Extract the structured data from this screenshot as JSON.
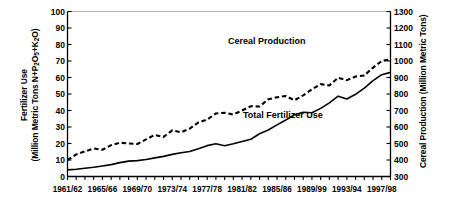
{
  "chart_data": {
    "type": "line",
    "title": "",
    "xlabel": "",
    "grid": false,
    "legend_position": "inline-annotation",
    "x": [
      "1961/62",
      "1962/63",
      "1963/64",
      "1964/65",
      "1965/66",
      "1966/67",
      "1967/68",
      "1968/69",
      "1969/70",
      "1970/71",
      "1971/72",
      "1972/73",
      "1973/74",
      "1974/75",
      "1975/76",
      "1976/77",
      "1977/78",
      "1978/79",
      "1979/80",
      "1980/81",
      "1981/82",
      "1982/83",
      "1983/84",
      "1984/85",
      "1985/86",
      "1986/87",
      "1987/88",
      "1988/89",
      "1989/99",
      "1990/91",
      "1991/92",
      "1992/93",
      "1993/94",
      "1994/95",
      "1995/96",
      "1996/97",
      "1997/98",
      "1998/99"
    ],
    "xticklabels": [
      "1961/62",
      "1965/66",
      "1969/70",
      "1973/74",
      "1977/78",
      "1981/82",
      "1985/86",
      "1989/99",
      "1993/94",
      "1997/98"
    ],
    "xtick_indices": [
      0,
      4,
      8,
      12,
      16,
      20,
      24,
      28,
      32,
      36
    ],
    "axes": [
      {
        "id": "left",
        "label_line1": "Fertilizer Use",
        "label_line2_prefix": "(Million Metric Tons N+P",
        "label_line2_sub1": "2",
        "label_line2_mid": "O",
        "label_line2_sub2": "5",
        "label_line2_mid2": "+K",
        "label_line2_sub3": "2",
        "label_line2_suffix": "O)",
        "label_plain": "Fertilizer Use (Million Metric Tons N+P2O5+K2O)",
        "ylim": [
          0,
          100
        ],
        "ticks": [
          0,
          10,
          20,
          30,
          40,
          50,
          60,
          70,
          80,
          90,
          100
        ]
      },
      {
        "id": "right",
        "label_plain": "Cereal Production (Million Metric Tons)",
        "ylim": [
          300,
          1300
        ],
        "ticks": [
          300,
          400,
          500,
          600,
          700,
          800,
          900,
          1000,
          1100,
          1200,
          1300
        ]
      }
    ],
    "series": [
      {
        "name": "Total Fertilizer Use",
        "axis": "left",
        "style": "solid",
        "color": "#000000",
        "units": "Million Metric Tons N+P2O5+K2O",
        "values": [
          4.0,
          4.4,
          5.0,
          5.6,
          6.4,
          7.2,
          8.4,
          9.3,
          9.6,
          10.3,
          11.3,
          12.2,
          13.4,
          14.4,
          15.2,
          16.8,
          18.7,
          19.9,
          18.6,
          19.8,
          21.2,
          22.6,
          25.9,
          28.2,
          31.3,
          34.2,
          37.4,
          38.9,
          38.6,
          41.3,
          44.6,
          48.7,
          47.0,
          49.8,
          53.6,
          58.1,
          61.7,
          63.1
        ]
      },
      {
        "name": "Cereal Production",
        "axis": "right",
        "style": "dashed",
        "color": "#000000",
        "units": "Million Metric Tons",
        "values": [
          400,
          434,
          452,
          470,
          462,
          490,
          505,
          500,
          497,
          525,
          552,
          540,
          580,
          568,
          590,
          628,
          645,
          682,
          686,
          676,
          700,
          726,
          724,
          768,
          780,
          788,
          762,
          792,
          828,
          860,
          852,
          898,
          884,
          906,
          912,
          960,
          1000,
          1010
        ]
      }
    ],
    "annotations": [
      {
        "id": "cereal-production",
        "text": "Cereal Production"
      },
      {
        "id": "total-fertilizer-use",
        "text": "Total Fertilizer Use"
      }
    ]
  },
  "colors": {
    "axis": "#000000",
    "series": "#000000",
    "background": "#ffffff"
  }
}
